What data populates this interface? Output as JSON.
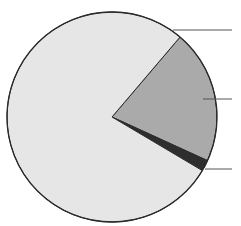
{
  "chart_data": {
    "type": "pie",
    "title": "",
    "start_angle_deg": -49.6,
    "direction": "clockwise",
    "slices": [
      {
        "label": "",
        "value": 20.6,
        "color": "#aaaaaa"
      },
      {
        "label": "",
        "value": 1.7,
        "color": "#2e2e2e"
      },
      {
        "label": "",
        "value": 77.7,
        "color": "#e6e6e6"
      }
    ],
    "leader_lines": [
      "slice-1",
      "slice-2",
      "slice-3"
    ],
    "legend": "none"
  }
}
